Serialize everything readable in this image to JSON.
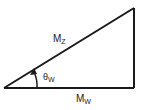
{
  "diagram": {
    "type": "right-triangle",
    "hypotenuse_label": {
      "main": "M",
      "sub": "Z"
    },
    "base_label": {
      "main": "M",
      "sub": "W"
    },
    "angle_label": {
      "main": "θ",
      "sub": "W"
    },
    "stroke_color": "#1a1a1a",
    "text_color": "#222222"
  }
}
